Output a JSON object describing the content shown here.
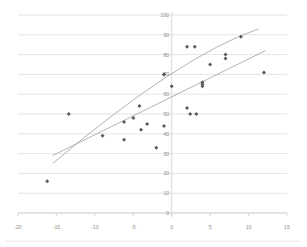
{
  "chart_data": {
    "type": "scatter",
    "title": "",
    "subtitle": "",
    "xlabel": "",
    "ylabel": "",
    "xlim": [
      -20,
      15
    ],
    "ylim": [
      0,
      100
    ],
    "xticks": [
      -20,
      -15,
      -10,
      -5,
      0,
      5,
      10,
      15
    ],
    "xticklabels": [
      "-20",
      "-15",
      "-10",
      "-5",
      "0",
      "5",
      "10",
      "15"
    ],
    "yticks": [
      0,
      10,
      20,
      30,
      40,
      50,
      60,
      70,
      80,
      90,
      100
    ],
    "yticklabels": [
      "0",
      "10",
      "20",
      "30",
      "40",
      "50",
      "60",
      "70",
      "80",
      "90",
      "100"
    ],
    "grid": "horizontal",
    "legend": "none",
    "marker_color": "#5a5a5a",
    "marker_shape": "diamond",
    "gridline_color": "#d2d2d2",
    "trendline_color": "#9a9a9a",
    "points": [
      {
        "x": -16.2,
        "y": 16
      },
      {
        "x": -13.4,
        "y": 50
      },
      {
        "x": -9.0,
        "y": 39
      },
      {
        "x": -6.2,
        "y": 46
      },
      {
        "x": -6.2,
        "y": 37
      },
      {
        "x": -5.0,
        "y": 48
      },
      {
        "x": -4.2,
        "y": 54
      },
      {
        "x": -4.0,
        "y": 42
      },
      {
        "x": -3.2,
        "y": 45
      },
      {
        "x": -2.0,
        "y": 33
      },
      {
        "x": -1.0,
        "y": 44
      },
      {
        "x": -1.0,
        "y": 70
      },
      {
        "x": -1.0,
        "y": 70
      },
      {
        "x": 0.0,
        "y": 64
      },
      {
        "x": 2.0,
        "y": 84
      },
      {
        "x": 2.0,
        "y": 53
      },
      {
        "x": 2.4,
        "y": 50
      },
      {
        "x": 3.0,
        "y": 84
      },
      {
        "x": 3.2,
        "y": 50
      },
      {
        "x": 4.0,
        "y": 66
      },
      {
        "x": 4.0,
        "y": 65
      },
      {
        "x": 4.0,
        "y": 64
      },
      {
        "x": 5.0,
        "y": 75
      },
      {
        "x": 7.0,
        "y": 80
      },
      {
        "x": 7.0,
        "y": 78
      },
      {
        "x": 9.0,
        "y": 89
      },
      {
        "x": 12.0,
        "y": 71
      }
    ],
    "trendlines": [
      {
        "name": "linear-fit",
        "kind": "linear",
        "x_start": -15.5,
        "x_end": 12.2,
        "y_start": 29,
        "y_end": 82
      },
      {
        "name": "polynomial-fit",
        "kind": "curve",
        "x_start": -15.5,
        "x_end": 11.3,
        "y_start": 25,
        "y_end": 93
      }
    ]
  }
}
